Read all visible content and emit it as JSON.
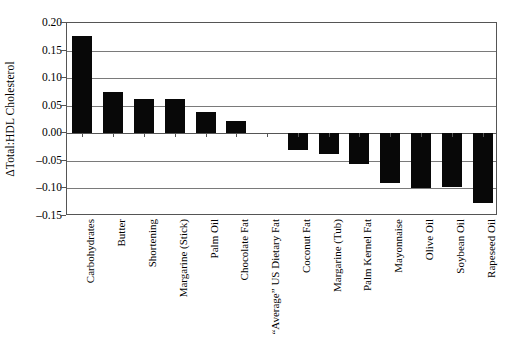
{
  "chart_data": {
    "type": "bar",
    "title": "",
    "xlabel": "",
    "ylabel": "ΔTotal:HDL Cholesterol",
    "ylim": [
      -0.15,
      0.2
    ],
    "ytick_values": [
      0.2,
      0.15,
      0.1,
      0.05,
      0.0,
      -0.05,
      -0.1,
      -0.15
    ],
    "ytick_labels": [
      "0.20",
      "0.15",
      "0.10",
      "0.05",
      "0.00",
      "–0.05",
      "–0.10",
      "–0.15"
    ],
    "grid": true,
    "legend": "none",
    "categories": [
      "Carbohydrates",
      "Butter",
      "Shortening",
      "Margarine (Stick)",
      "Palm Oil",
      "Chocolate Fat",
      "“Average” US Dietary Fat",
      "Coconut Fat",
      "Margarine (Tub)",
      "Palm Kernel Fat",
      "Mayonnaise",
      "Olive Oil",
      "Soybean Oil",
      "Rapeseed Oil"
    ],
    "values": [
      0.177,
      0.075,
      0.063,
      0.062,
      0.038,
      0.022,
      0.0,
      -0.031,
      -0.038,
      -0.055,
      -0.09,
      -0.099,
      -0.098,
      -0.127
    ],
    "bar_color": "#080808",
    "grid_color": "#7a7a7a",
    "axis_color": "#555555"
  }
}
